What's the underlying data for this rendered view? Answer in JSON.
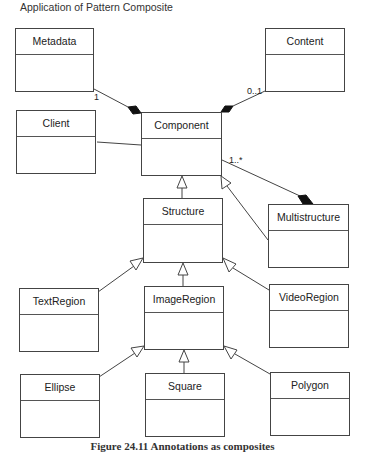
{
  "title": "Application of Pattern Composite",
  "caption": "Figure 24.11  Annotations as composites",
  "classes": {
    "metadata": "Metadata",
    "content": "Content",
    "client": "Client",
    "component": "Component",
    "structure": "Structure",
    "multistructure": "Multistructure",
    "textregion": "TextRegion",
    "imageregion": "ImageRegion",
    "videoregion": "VideoRegion",
    "ellipse": "Ellipse",
    "square": "Square",
    "polygon": "Polygon"
  },
  "multiplicities": {
    "metadata_component": "1",
    "content_component": "0..1",
    "component_multistructure": "1..*"
  },
  "relationships": [
    {
      "from": "Component",
      "to": "Metadata",
      "type": "composition",
      "multiplicity": "1"
    },
    {
      "from": "Component",
      "to": "Content",
      "type": "composition",
      "multiplicity": "0..1"
    },
    {
      "from": "Client",
      "to": "Component",
      "type": "association"
    },
    {
      "from": "Structure",
      "to": "Component",
      "type": "generalization"
    },
    {
      "from": "Multistructure",
      "to": "Component",
      "type": "generalization"
    },
    {
      "from": "Multistructure",
      "to": "Component",
      "type": "composition",
      "multiplicity": "1..*"
    },
    {
      "from": "TextRegion",
      "to": "Structure",
      "type": "generalization"
    },
    {
      "from": "ImageRegion",
      "to": "Structure",
      "type": "generalization"
    },
    {
      "from": "VideoRegion",
      "to": "Structure",
      "type": "generalization"
    },
    {
      "from": "Ellipse",
      "to": "ImageRegion",
      "type": "generalization"
    },
    {
      "from": "Square",
      "to": "ImageRegion",
      "type": "generalization"
    },
    {
      "from": "Polygon",
      "to": "ImageRegion",
      "type": "generalization"
    }
  ]
}
